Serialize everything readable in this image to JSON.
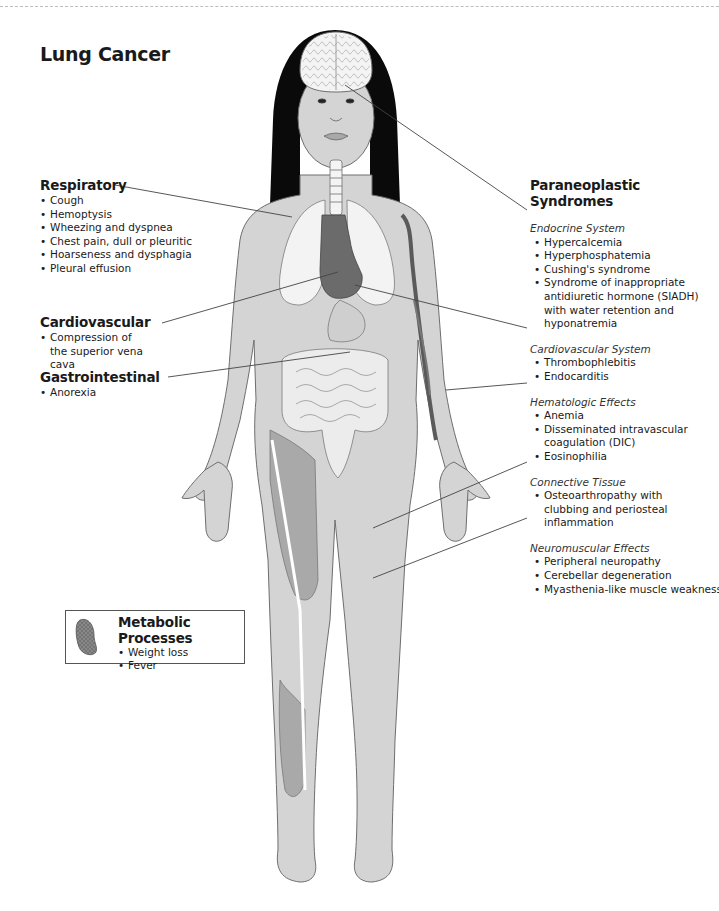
{
  "title": "Lung Cancer",
  "colors": {
    "skin": "#d4d4d4",
    "outline": "#6e6e6e",
    "hair": "#0a0a0a",
    "organ_dark": "#6b6b6b",
    "lung": "#f2f2f2",
    "muscle": "#a9a9a9",
    "leader_line": "#444444"
  },
  "left_sections": {
    "respiratory": {
      "heading": "Respiratory",
      "items": [
        "Cough",
        "Hemoptysis",
        "Wheezing and dyspnea",
        "Chest pain, dull or pleuritic",
        "Hoarseness and dysphagia",
        "Pleural effusion"
      ]
    },
    "cardiovascular": {
      "heading": "Cardiovascular",
      "items": [
        "Compression of the superior vena cava"
      ]
    },
    "gastrointestinal": {
      "heading": "Gastrointestinal",
      "items": [
        "Anorexia"
      ]
    }
  },
  "paraneoplastic": {
    "heading": "Paraneoplastic Syndromes",
    "groups": [
      {
        "name": "Endocrine System",
        "items": [
          "Hypercalcemia",
          "Hyperphosphatemia",
          "Cushing's syndrome",
          "Syndrome of inappropriate antidiuretic hormone (SIADH) with water retention and hyponatremia"
        ]
      },
      {
        "name": "Cardiovascular System",
        "items": [
          "Thrombophlebitis",
          "Endocarditis"
        ]
      },
      {
        "name": "Hematologic Effects",
        "items": [
          "Anemia",
          "Disseminated intravascular coagulation (DIC)",
          "Eosinophilia"
        ]
      },
      {
        "name": "Connective Tissue",
        "items": [
          "Osteoarthropathy with clubbing and periosteal inflammation"
        ]
      },
      {
        "name": "Neuromuscular Effects",
        "items": [
          "Peripheral neuropathy",
          "Cerebellar degeneration",
          "Myasthenia-like muscle weakness"
        ]
      }
    ]
  },
  "metabolic": {
    "heading": "Metabolic Processes",
    "items": [
      "Weight loss",
      "Fever"
    ],
    "icon": "mitochondrion-icon"
  }
}
